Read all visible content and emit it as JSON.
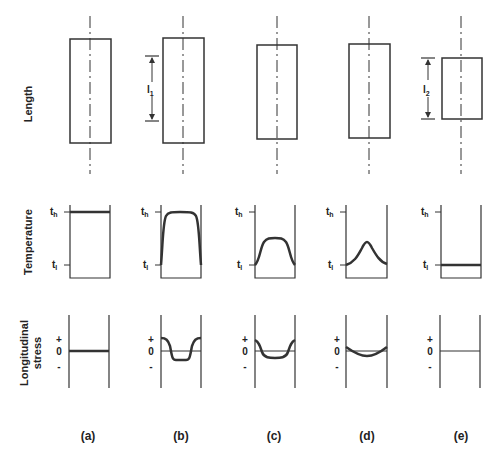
{
  "rows": {
    "length": "Length",
    "temperature": "Temperature",
    "stress_line1": "Longitudinal",
    "stress_line2": "stress"
  },
  "dimensions": {
    "l1": {
      "main": "l",
      "sub": "1"
    },
    "l2": {
      "main": "l",
      "sub": "2"
    }
  },
  "temperature_axis": {
    "high": {
      "main": "t",
      "sub": "h"
    },
    "low": {
      "main": "t",
      "sub": "l"
    }
  },
  "stress_axis": {
    "plus": "+",
    "zero": "0",
    "minus": "-"
  },
  "columns": [
    {
      "id": "a",
      "caption": "(a)",
      "temperature_profile": "uniform at t_h",
      "stress_profile": "zero"
    },
    {
      "id": "b",
      "caption": "(b)",
      "temperature_profile": "flat-topped near t_h, drops to t_l at ends",
      "stress_profile": "positive at ends, negative in middle"
    },
    {
      "id": "c",
      "caption": "(c)",
      "temperature_profile": "rounded plateau between t_l and t_h",
      "stress_profile": "positive at ends, slightly negative in middle"
    },
    {
      "id": "d",
      "caption": "(d)",
      "temperature_profile": "bell-shaped peak",
      "stress_profile": "small negative curvature"
    },
    {
      "id": "e",
      "caption": "(e)",
      "temperature_profile": "uniform at t_l",
      "stress_profile": "zero"
    }
  ]
}
